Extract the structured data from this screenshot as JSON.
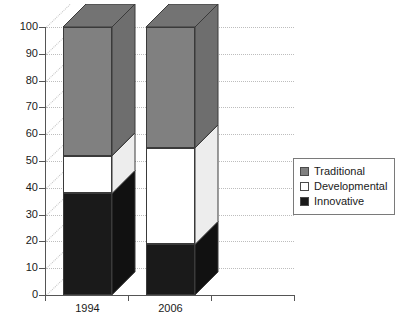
{
  "chart_data": {
    "type": "bar",
    "subtype": "stacked-column-3d",
    "title": "",
    "subtitle": "",
    "xlabel": "",
    "ylabel": "",
    "categories": [
      "1994",
      "2006"
    ],
    "series": [
      {
        "name": "Innovative",
        "values": [
          38,
          19
        ],
        "color": "#1a1a1a"
      },
      {
        "name": "Developmental",
        "values": [
          14,
          36
        ],
        "color": "#ffffff"
      },
      {
        "name": "Traditional",
        "values": [
          48,
          45
        ],
        "color": "#808080"
      }
    ],
    "stack_totals": [
      100,
      100
    ],
    "segment_boundaries": {
      "1994": {
        "innovative": [
          0,
          38
        ],
        "developmental": [
          38,
          52
        ],
        "traditional": [
          52,
          100
        ]
      },
      "2006": {
        "innovative": [
          0,
          19
        ],
        "developmental": [
          19,
          55
        ],
        "traditional": [
          55,
          100
        ]
      }
    },
    "ylim": [
      0,
      100
    ],
    "ytick_step": 10,
    "ytick_labels": [
      "0",
      "10",
      "20",
      "30",
      "40",
      "50",
      "60",
      "70",
      "80",
      "90",
      "100"
    ],
    "grid": true,
    "grid_style": "dotted",
    "legend_position": "right",
    "legend_entries": [
      "Traditional",
      "Developmental",
      "Innovative"
    ],
    "annotations": []
  },
  "legend": {
    "items": [
      {
        "label": "Traditional",
        "swatch": "#808080"
      },
      {
        "label": "Developmental",
        "swatch": "#ffffff"
      },
      {
        "label": "Innovative",
        "swatch": "#1a1a1a"
      }
    ]
  },
  "colors": {
    "traditional": "#808080",
    "traditional_top": "#737373",
    "traditional_side": "#6e6e6e",
    "developmental": "#ffffff",
    "developmental_top": "#f2f2f2",
    "developmental_side": "#ededed",
    "innovative": "#1a1a1a",
    "innovative_top": "#0d0d0d",
    "innovative_side": "#111111",
    "axis": "#555555",
    "grid": "#bdbdbd",
    "text": "#1a1a1a",
    "background": "#ffffff"
  }
}
